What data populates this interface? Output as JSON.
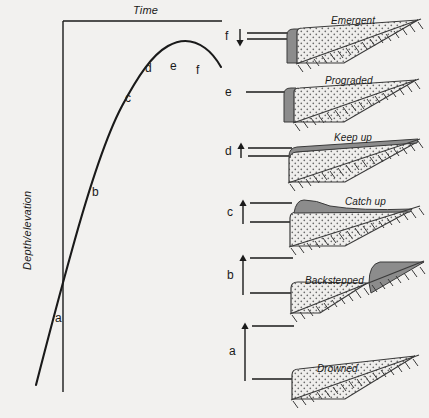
{
  "figure": {
    "axes": {
      "x_label": "Time",
      "y_label": "Depth/elevation"
    },
    "curve_labels": [
      {
        "text": "a",
        "x": 55,
        "y": 312
      },
      {
        "text": "b",
        "x": 92,
        "y": 186
      },
      {
        "text": "c",
        "x": 125,
        "y": 92
      },
      {
        "text": "d",
        "x": 145,
        "y": 62
      },
      {
        "text": "e",
        "x": 170,
        "y": 60
      },
      {
        "text": "f",
        "x": 196,
        "y": 64
      }
    ],
    "stages": [
      {
        "key": "f",
        "label": "f",
        "panel_title": "Emergent",
        "arrow": "down",
        "arrow_length": "short",
        "line_gap": "tight",
        "cap": "none",
        "wedge": "emergent"
      },
      {
        "key": "e",
        "label": "e",
        "panel_title": "Prograded",
        "arrow": "none",
        "arrow_length": "none",
        "line_gap": "single",
        "cap": "none",
        "wedge": "prograded"
      },
      {
        "key": "d",
        "label": "d",
        "panel_title": "Keep up",
        "arrow": "up",
        "arrow_length": "short",
        "line_gap": "tight",
        "cap": "full",
        "wedge": "keepup"
      },
      {
        "key": "c",
        "label": "c",
        "panel_title": "Catch up",
        "arrow": "up",
        "arrow_length": "medium",
        "line_gap": "medium",
        "cap": "thin",
        "wedge": "catchup"
      },
      {
        "key": "b",
        "label": "b",
        "panel_title": "Backstepped",
        "arrow": "up",
        "arrow_length": "long",
        "line_gap": "wide",
        "cap": "upslope",
        "wedge": "backstepped"
      },
      {
        "key": "a",
        "label": "a",
        "panel_title": "Drowned",
        "arrow": "up",
        "arrow_length": "longest",
        "line_gap": "widest",
        "cap": "none",
        "wedge": "drowned"
      }
    ],
    "colors": {
      "background": "#f2f1ef",
      "ink": "#1a1a1a",
      "stipple_fill": "#efeeec",
      "stipple_dot": "#6b6b6b",
      "dark_unit": "#8c8c8c",
      "hatch": "#3a3a3a"
    }
  }
}
